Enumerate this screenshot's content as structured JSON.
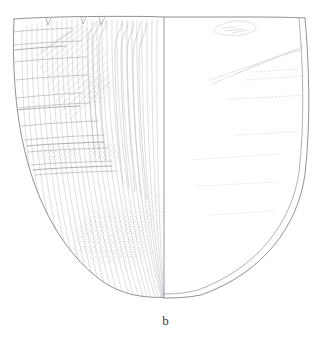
{
  "figure": {
    "caption": "b",
    "background_color": "#ffffff",
    "views": {
      "left": {
        "name": "exterior-surface-view",
        "description": "exterior decorated surface with vertical striations, horizontal banding, diagonal hatching and stippled wear patches"
      },
      "right": {
        "name": "section-interior-view",
        "description": "plain interior / section view with double-line wall profile and faint incised guide lines"
      }
    },
    "centerline": {
      "name": "vertical-centerline",
      "x": 164,
      "y_top": 17,
      "y_bottom": 297,
      "color": "#8d8d93"
    },
    "outline": {
      "color": "#8a8a90",
      "wall_color": "#9a9aa0",
      "rim_y": 17,
      "base_y": 297,
      "left_x": 13,
      "right_x": 313
    },
    "ink_colors": {
      "outline": "#85858b",
      "striation": "#b9b9bf",
      "band": "#9d9da4",
      "hatch": "#c3c3c9",
      "stipple": "#a9a9ae",
      "faint_line": "#cdcdd3",
      "caption": "#3a3a3a"
    },
    "rim_notches": [
      {
        "x": 48,
        "width": 5
      },
      {
        "x": 83,
        "width": 5
      },
      {
        "x": 100,
        "width": 6
      }
    ],
    "stipple_patches": [
      {
        "name": "stipple-patch-upper",
        "cx": 97,
        "cy": 90,
        "rx": 19,
        "ry": 16
      },
      {
        "name": "stipple-patch-mid-left",
        "cx": 58,
        "cy": 155,
        "rx": 22,
        "ry": 11
      },
      {
        "name": "stipple-patch-mid-right",
        "cx": 103,
        "cy": 152,
        "rx": 19,
        "ry": 13
      },
      {
        "name": "stipple-patch-lower-large",
        "cx": 113,
        "cy": 235,
        "rx": 45,
        "ry": 34
      },
      {
        "name": "stipple-patch-lower-right",
        "cx": 155,
        "cy": 210,
        "rx": 16,
        "ry": 22
      }
    ],
    "horizontal_bands_left": [
      14,
      27,
      44,
      62,
      80,
      108,
      126,
      140,
      152,
      165,
      175
    ],
    "faint_marks_right": [
      {
        "name": "chip-mark-top",
        "x": 228,
        "y": 24
      },
      {
        "name": "diagonal-mark-upper",
        "x1": 215,
        "y1": 82,
        "x2": 300,
        "y2": 48
      },
      {
        "name": "diagonal-mark-lower",
        "x1": 210,
        "y1": 80,
        "x2": 302,
        "y2": 56
      },
      {
        "name": "dotted-line-1",
        "x1": 248,
        "y1": 79,
        "x2": 306,
        "y2": 76
      },
      {
        "name": "dotted-line-2",
        "x1": 228,
        "y1": 98,
        "x2": 303,
        "y2": 96
      },
      {
        "name": "dotted-line-3",
        "x1": 238,
        "y1": 134,
        "x2": 298,
        "y2": 132
      }
    ]
  }
}
